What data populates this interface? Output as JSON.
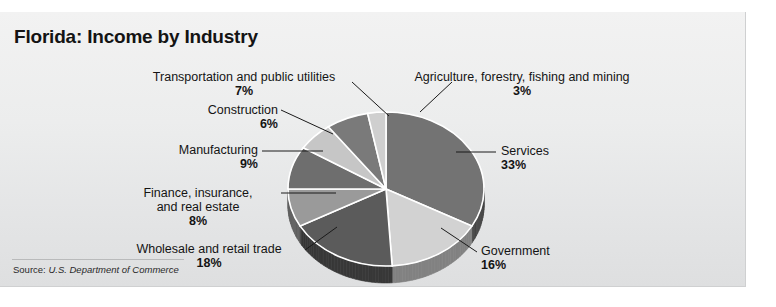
{
  "figure": {
    "title": "Florida: Income by Industry",
    "source_label": "Source:",
    "source_value": "U.S. Department of Commerce"
  },
  "chart_data": {
    "type": "pie",
    "title": "Florida: Income by Industry",
    "subtitle": "",
    "xlabel": "",
    "ylabel": "",
    "legend_position": "none",
    "grid": false,
    "units": "percent",
    "style": "3d-pie",
    "start_angle_deg": 0,
    "direction": "clockwise",
    "categories": [
      "Services",
      "Government",
      "Wholesale and retail trade",
      "Finance, insurance, and real estate",
      "Manufacturing",
      "Construction",
      "Transportation and public utilities",
      "Agriculture, forestry, fishing and mining"
    ],
    "values": [
      33,
      16,
      18,
      8,
      9,
      6,
      7,
      3
    ],
    "slices": [
      {
        "label": "Services",
        "label_line1": "Services",
        "label_line2": "",
        "value": 33,
        "pct_text": "33%",
        "color": "#737373"
      },
      {
        "label": "Government",
        "label_line1": "Government",
        "label_line2": "",
        "value": 16,
        "pct_text": "16%",
        "color": "#d2d2d2"
      },
      {
        "label": "Wholesale and retail trade",
        "label_line1": "Wholesale and retail trade",
        "label_line2": "",
        "value": 18,
        "pct_text": "18%",
        "color": "#5b5b5b"
      },
      {
        "label": "Finance, insurance, and real estate",
        "label_line1": "Finance, insurance,",
        "label_line2": "and real estate",
        "value": 8,
        "pct_text": "8%",
        "color": "#9a9a9a"
      },
      {
        "label": "Manufacturing",
        "label_line1": "Manufacturing",
        "label_line2": "",
        "value": 9,
        "pct_text": "9%",
        "color": "#6e6e6e"
      },
      {
        "label": "Construction",
        "label_line1": "Construction",
        "label_line2": "",
        "value": 6,
        "pct_text": "6%",
        "color": "#c6c6c6"
      },
      {
        "label": "Transportation and public utilities",
        "label_line1": "Transportation and public utilities",
        "label_line2": "",
        "value": 7,
        "pct_text": "7%",
        "color": "#7a7a7a"
      },
      {
        "label": "Agriculture, forestry, fishing and mining",
        "label_line1": "Agriculture, forestry, fishing and mining",
        "label_line2": "",
        "value": 3,
        "pct_text": "3%",
        "color": "#cfcfcf"
      }
    ],
    "colors": {
      "background": "#ebecec",
      "text": "#141414",
      "leader_line": "#1a1a1a"
    }
  }
}
